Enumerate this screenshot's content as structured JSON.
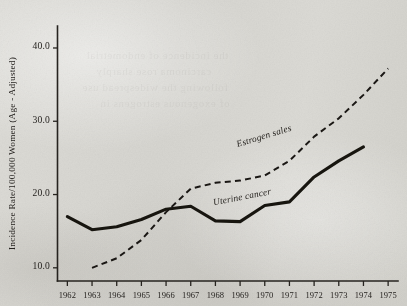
{
  "chart_data": {
    "type": "line",
    "title": "",
    "xlabel": "",
    "ylabel": "Incidence Rate/100,000 Women (Age - Adjusted)",
    "x": [
      1962,
      1963,
      1964,
      1965,
      1966,
      1967,
      1968,
      1969,
      1970,
      1971,
      1972,
      1973,
      1974,
      1975
    ],
    "xtick_labels": [
      "1962",
      "1963",
      "1964",
      "1965",
      "1966",
      "1967",
      "1968",
      "1969",
      "1970",
      "1971",
      "1972",
      "1973",
      "1974",
      "1975"
    ],
    "ytick_labels": [
      "10.0",
      "20.0",
      "30.0",
      "40.0"
    ],
    "ytick_values": [
      10.0,
      20.0,
      30.0,
      40.0
    ],
    "ylim": [
      8.2,
      43.0
    ],
    "xlim": [
      1961.6,
      1975.4
    ],
    "grid": false,
    "legend_position": "inline-annotations",
    "series": [
      {
        "name": "Uterine cancer",
        "style": "solid",
        "label_x": 1969.1,
        "label_y": 19.3,
        "label_rotation": -11,
        "x": [
          1962,
          1963,
          1964,
          1965,
          1966,
          1967,
          1968,
          1969,
          1970,
          1971,
          1972,
          1973,
          1974
        ],
        "values": [
          17.0,
          15.2,
          15.6,
          16.6,
          18.0,
          18.4,
          16.4,
          16.3,
          18.5,
          19.0,
          22.4,
          24.6,
          26.5
        ]
      },
      {
        "name": "Estrogen sales",
        "style": "dashed",
        "label_x": 1970.0,
        "label_y": 27.6,
        "label_rotation": -17,
        "x": [
          1963,
          1964,
          1965,
          1966,
          1967,
          1968,
          1969,
          1970,
          1971,
          1972,
          1973,
          1974,
          1975
        ],
        "values": [
          10.0,
          11.3,
          13.8,
          17.6,
          20.8,
          21.6,
          21.9,
          22.6,
          24.6,
          27.9,
          30.4,
          33.6,
          37.2
        ]
      }
    ],
    "annotations": [
      {
        "name": "estrogen-sales-label",
        "text": "Estrogen sales"
      },
      {
        "name": "uterine-cancer-label",
        "text": "Uterine cancer"
      }
    ],
    "colors": {
      "ink": "#1d1b19",
      "paper": "#d8d7d2",
      "axis": "#26231f"
    }
  },
  "ghost_text": {
    "lines": [
      "the incidence of endometrial",
      "carcinoma rose sharply",
      "following the widespread use",
      "of exogenous estrogens in"
    ]
  }
}
